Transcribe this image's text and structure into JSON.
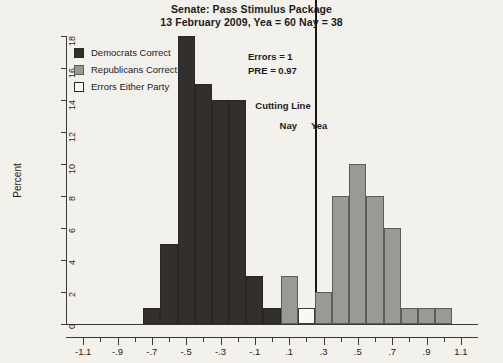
{
  "title": {
    "line1": "Senate: Pass Stimulus Package",
    "line2": "13 February 2009, Yea = 60   Nay = 38"
  },
  "legend": {
    "position": "top-left-inside",
    "items": [
      {
        "label": "Democrats Correct",
        "swatch": "dem",
        "color": "#332f2d"
      },
      {
        "label": "Republicans Correct",
        "swatch": "rep",
        "color": "#9a9a95"
      },
      {
        "label": "Errors Either Party",
        "swatch": "err",
        "color": "#faf8f3"
      }
    ]
  },
  "annotations": {
    "errors": "Errors = 1",
    "pre": "PRE = 0.97",
    "cutting_line": "Cutting Line",
    "nay": "Nay",
    "yea": "Yea"
  },
  "chart_data": {
    "type": "bar",
    "xlabel": "",
    "ylabel": "Percent",
    "xlim": [
      -1.2,
      1.2
    ],
    "ylim": [
      0,
      18
    ],
    "grid": false,
    "bin_width": 0.1,
    "cutting_line_x": 0.25,
    "yticks": [
      0,
      2,
      4,
      6,
      8,
      10,
      12,
      14,
      16,
      18
    ],
    "xticks_major": [
      -1.1,
      -0.9,
      -0.7,
      -0.5,
      -0.3,
      -0.1,
      0.1,
      0.3,
      0.5,
      0.7,
      0.9,
      1.1
    ],
    "xticks_minor": [
      -1.0,
      -0.8,
      -0.6,
      -0.4,
      -0.2,
      0.0,
      0.2,
      0.4,
      0.6,
      0.8,
      1.0
    ],
    "xtick_labels": [
      "-1.1",
      "-.9",
      "-.7",
      "-.5",
      "-.3",
      "-.1",
      ".1",
      ".3",
      ".5",
      ".7",
      ".9",
      "1.1"
    ],
    "series": [
      {
        "name": "Democrats Correct",
        "color": "#332f2d",
        "bars": [
          {
            "x0": -0.75,
            "x1": -0.65,
            "value": 1
          },
          {
            "x0": -0.65,
            "x1": -0.55,
            "value": 5
          },
          {
            "x0": -0.55,
            "x1": -0.45,
            "value": 18
          },
          {
            "x0": -0.45,
            "x1": -0.35,
            "value": 15
          },
          {
            "x0": -0.35,
            "x1": -0.25,
            "value": 14
          },
          {
            "x0": -0.25,
            "x1": -0.15,
            "value": 14
          },
          {
            "x0": -0.15,
            "x1": -0.05,
            "value": 3
          },
          {
            "x0": -0.05,
            "x1": 0.05,
            "value": 1
          }
        ]
      },
      {
        "name": "Republicans Correct",
        "color": "#9a9a95",
        "bars": [
          {
            "x0": 0.05,
            "x1": 0.15,
            "value": 3
          },
          {
            "x0": 0.25,
            "x1": 0.35,
            "value": 2
          },
          {
            "x0": 0.35,
            "x1": 0.45,
            "value": 8
          },
          {
            "x0": 0.45,
            "x1": 0.55,
            "value": 10
          },
          {
            "x0": 0.55,
            "x1": 0.65,
            "value": 8
          },
          {
            "x0": 0.65,
            "x1": 0.75,
            "value": 6
          },
          {
            "x0": 0.75,
            "x1": 0.85,
            "value": 1
          },
          {
            "x0": 0.85,
            "x1": 0.95,
            "value": 1
          },
          {
            "x0": 0.95,
            "x1": 1.05,
            "value": 1
          }
        ]
      },
      {
        "name": "Errors Either Party",
        "color": "#faf8f3",
        "bars": [
          {
            "x0": 0.15,
            "x1": 0.25,
            "value": 1
          }
        ]
      }
    ]
  }
}
